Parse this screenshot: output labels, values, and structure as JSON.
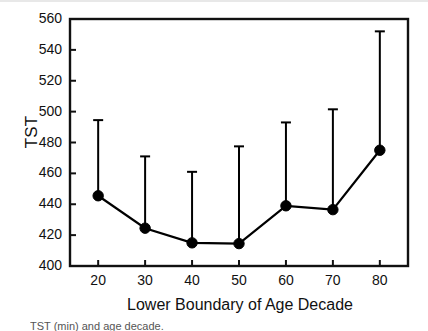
{
  "figure": {
    "caption_partial": "TST (min) and age decade."
  },
  "chart_data": {
    "type": "line",
    "title": "",
    "subtitle": "",
    "xlabel": "Lower Boundary of Age Decade",
    "ylabel": "TST",
    "x": [
      20,
      30,
      40,
      50,
      60,
      70,
      80
    ],
    "xticklabels": [
      "20",
      "30",
      "40",
      "50",
      "60",
      "70",
      "80"
    ],
    "yticks": [
      400,
      420,
      440,
      460,
      480,
      500,
      520,
      540,
      560
    ],
    "yticklabels": [
      "400",
      "420",
      "440",
      "460",
      "480",
      "500",
      "520",
      "540",
      "560"
    ],
    "xlim": [
      14,
      86
    ],
    "ylim": [
      400,
      560
    ],
    "grid": false,
    "legend": null,
    "marker": "filled-circle",
    "error_bar_direction": "upper-only",
    "series": [
      {
        "name": "TST",
        "values": [
          445.5,
          424.5,
          415.0,
          414.5,
          439.0,
          436.5,
          475.0
        ],
        "error_upper": [
          494.5,
          471.0,
          461.0,
          477.5,
          493.0,
          501.5,
          552.0
        ],
        "color": "#000000"
      }
    ]
  }
}
